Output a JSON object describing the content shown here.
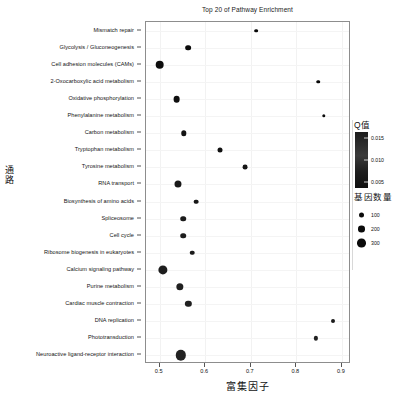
{
  "chart_data": {
    "type": "scatter",
    "title": "Top 20 of Pathway Enrichment",
    "xlabel": "富集因子",
    "ylabel": "通路",
    "xlim": [
      0.47,
      0.92
    ],
    "ylim_categories_count": 20,
    "grid": true,
    "xticks": [
      0.5,
      0.6,
      0.7,
      0.8,
      0.9
    ],
    "xticklabels": [
      "0.5",
      "0.6",
      "0.7",
      "0.8",
      "0.9"
    ],
    "categories": [
      "Mismatch repair",
      "Glycolysis / Gluconeogenesis",
      "Cell adhesion molecules (CAMs)",
      "2-Oxocarboxylic acid metabolism",
      "Oxidative phosphorylation",
      "Phenylalanine metabolism",
      "Carbon metabolism",
      "Tryptophan metabolism",
      "Tyrosine metabolism",
      "RNA transport",
      "Biosynthesis of amino acids",
      "Spliceosome",
      "Cell cycle",
      "Ribosome biogenesis in eukaryotes",
      "Calcium signaling pathway",
      "Purine metabolism",
      "Cardiac muscle contraction",
      "DNA replication",
      "Phototransduction",
      "Neuroactive ligand-receptor interaction"
    ],
    "points": [
      {
        "category": "Mismatch repair",
        "x": 0.712,
        "gene_count": 60,
        "qvalue": 0.004
      },
      {
        "category": "Glycolysis / Gluconeogenesis",
        "x": 0.562,
        "gene_count": 130,
        "qvalue": 0.005
      },
      {
        "category": "Cell adhesion molecules (CAMs)",
        "x": 0.5,
        "gene_count": 230,
        "qvalue": 0.006
      },
      {
        "category": "2-Oxocarboxylic acid metabolism",
        "x": 0.848,
        "gene_count": 55,
        "qvalue": 0.004
      },
      {
        "category": "Oxidative phosphorylation",
        "x": 0.537,
        "gene_count": 165,
        "qvalue": 0.007
      },
      {
        "category": "Phenylalanine metabolism",
        "x": 0.86,
        "gene_count": 50,
        "qvalue": 0.005
      },
      {
        "category": "Carbon metabolism",
        "x": 0.553,
        "gene_count": 120,
        "qvalue": 0.009
      },
      {
        "category": "Tryptophan metabolism",
        "x": 0.633,
        "gene_count": 105,
        "qvalue": 0.008
      },
      {
        "category": "Tyrosine metabolism",
        "x": 0.688,
        "gene_count": 100,
        "qvalue": 0.01
      },
      {
        "category": "RNA transport",
        "x": 0.54,
        "gene_count": 175,
        "qvalue": 0.011
      },
      {
        "category": "Biosynthesis of amino acids",
        "x": 0.58,
        "gene_count": 95,
        "qvalue": 0.01
      },
      {
        "category": "Spliceosome",
        "x": 0.552,
        "gene_count": 125,
        "qvalue": 0.012
      },
      {
        "category": "Cell cycle",
        "x": 0.552,
        "gene_count": 125,
        "qvalue": 0.013
      },
      {
        "category": "Ribosome biogenesis in eukaryotes",
        "x": 0.572,
        "gene_count": 90,
        "qvalue": 0.012
      },
      {
        "category": "Calcium signaling pathway",
        "x": 0.507,
        "gene_count": 250,
        "qvalue": 0.013
      },
      {
        "category": "Purine metabolism",
        "x": 0.545,
        "gene_count": 185,
        "qvalue": 0.014
      },
      {
        "category": "Cardiac muscle contraction",
        "x": 0.563,
        "gene_count": 150,
        "qvalue": 0.014
      },
      {
        "category": "DNA replication",
        "x": 0.88,
        "gene_count": 70,
        "qvalue": 0.012
      },
      {
        "category": "Phototransduction",
        "x": 0.843,
        "gene_count": 80,
        "qvalue": 0.015
      },
      {
        "category": "Neuroactive ligand-receptor interaction",
        "x": 0.547,
        "gene_count": 290,
        "qvalue": 0.015
      }
    ]
  },
  "legend": {
    "qvalue": {
      "title": "Q值",
      "ticks": [
        "0.015",
        "0.010",
        "0.005"
      ]
    },
    "gene_count": {
      "title": "基因数量",
      "items": [
        {
          "label": "100",
          "size": 5.0
        },
        {
          "label": "200",
          "size": 6.6
        },
        {
          "label": "300",
          "size": 8.6
        }
      ]
    }
  }
}
